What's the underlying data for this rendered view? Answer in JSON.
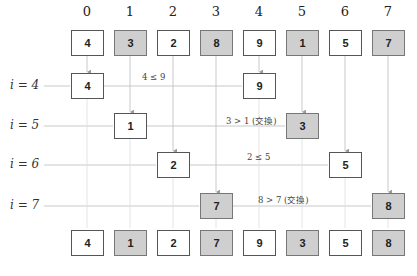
{
  "diagram": {
    "title": "",
    "indices": [
      "0",
      "1",
      "2",
      "3",
      "4",
      "5",
      "6",
      "7"
    ],
    "initial_array": [
      {
        "value": "4",
        "shaded": false
      },
      {
        "value": "3",
        "shaded": true
      },
      {
        "value": "2",
        "shaded": false
      },
      {
        "value": "8",
        "shaded": true
      },
      {
        "value": "9",
        "shaded": false
      },
      {
        "value": "1",
        "shaded": true
      },
      {
        "value": "5",
        "shaded": false
      },
      {
        "value": "7",
        "shaded": true
      }
    ],
    "steps": [
      {
        "label": "i = 4",
        "left": {
          "col": 0,
          "value": "4",
          "shaded": false
        },
        "right": {
          "col": 4,
          "value": "9",
          "shaded": false
        },
        "comparison": "4 ≤ 9"
      },
      {
        "label": "i = 5",
        "left": {
          "col": 1,
          "value": "1",
          "shaded": false
        },
        "right": {
          "col": 5,
          "value": "3",
          "shaded": true
        },
        "comparison": "3 > 1 (交換)"
      },
      {
        "label": "i = 6",
        "left": {
          "col": 2,
          "value": "2",
          "shaded": false
        },
        "right": {
          "col": 6,
          "value": "5",
          "shaded": false
        },
        "comparison": "2 ≤ 5"
      },
      {
        "label": "i = 7",
        "left": {
          "col": 3,
          "value": "7",
          "shaded": true
        },
        "right": {
          "col": 7,
          "value": "8",
          "shaded": true
        },
        "comparison": "8 > 7 (交換)"
      }
    ],
    "final_array": [
      {
        "value": "4",
        "shaded": false
      },
      {
        "value": "1",
        "shaded": true
      },
      {
        "value": "2",
        "shaded": false
      },
      {
        "value": "7",
        "shaded": true
      },
      {
        "value": "9",
        "shaded": false
      },
      {
        "value": "3",
        "shaded": true
      },
      {
        "value": "5",
        "shaded": false
      },
      {
        "value": "8",
        "shaded": true
      }
    ],
    "colors": {
      "shaded": "#cfcfcf",
      "border": "#555555",
      "line": "#bbbbbb",
      "arrow": "#999999"
    }
  }
}
